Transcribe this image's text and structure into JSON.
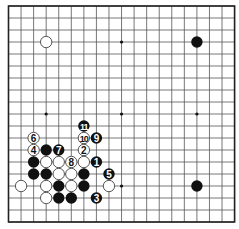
{
  "board": {
    "size": 19,
    "origin_x": 8.5,
    "origin_y": 6,
    "spacing_x": 12.56,
    "spacing_y": 12.0,
    "line_color": "#555555",
    "border_color": "#222222",
    "black_color": "#111111",
    "white_fill": "#ffffff",
    "white_stroke": "#444444",
    "star_points": [
      [
        3,
        3
      ],
      [
        9,
        3
      ],
      [
        15,
        3
      ],
      [
        3,
        9
      ],
      [
        9,
        9
      ],
      [
        15,
        9
      ],
      [
        3,
        15
      ],
      [
        9,
        15
      ],
      [
        15,
        15
      ]
    ]
  },
  "stones": [
    {
      "color": "white",
      "col": 3,
      "row": 3,
      "label": ""
    },
    {
      "color": "black",
      "col": 15,
      "row": 3,
      "label": ""
    },
    {
      "color": "black",
      "col": 15,
      "row": 15,
      "label": ""
    },
    {
      "color": "black",
      "col": 6,
      "row": 10,
      "label": "11"
    },
    {
      "color": "white",
      "col": 2,
      "row": 11,
      "label": "6"
    },
    {
      "color": "white",
      "col": 6,
      "row": 11,
      "label": "10"
    },
    {
      "color": "black",
      "col": 7,
      "row": 11,
      "label": "9"
    },
    {
      "color": "white",
      "col": 2,
      "row": 12,
      "label": "4"
    },
    {
      "color": "black",
      "col": 3,
      "row": 12,
      "label": ""
    },
    {
      "color": "black",
      "col": 4,
      "row": 12,
      "label": "7"
    },
    {
      "color": "white",
      "col": 6,
      "row": 12,
      "label": "2"
    },
    {
      "color": "black",
      "col": 2,
      "row": 13,
      "label": ""
    },
    {
      "color": "white",
      "col": 3,
      "row": 13,
      "label": ""
    },
    {
      "color": "white",
      "col": 4,
      "row": 13,
      "label": ""
    },
    {
      "color": "white",
      "col": 5,
      "row": 13,
      "label": "8"
    },
    {
      "color": "white",
      "col": 6,
      "row": 13,
      "label": ""
    },
    {
      "color": "black",
      "col": 7,
      "row": 13,
      "label": "1"
    },
    {
      "color": "black",
      "col": 2,
      "row": 14,
      "label": ""
    },
    {
      "color": "black",
      "col": 3,
      "row": 14,
      "label": ""
    },
    {
      "color": "white",
      "col": 4,
      "row": 14,
      "label": ""
    },
    {
      "color": "white",
      "col": 5,
      "row": 14,
      "label": ""
    },
    {
      "color": "black",
      "col": 6,
      "row": 14,
      "label": ""
    },
    {
      "color": "black",
      "col": 8,
      "row": 14,
      "label": "5"
    },
    {
      "color": "white",
      "col": 1,
      "row": 15,
      "label": ""
    },
    {
      "color": "white",
      "col": 3,
      "row": 15,
      "label": ""
    },
    {
      "color": "black",
      "col": 4,
      "row": 15,
      "label": ""
    },
    {
      "color": "white",
      "col": 5,
      "row": 15,
      "label": ""
    },
    {
      "color": "black",
      "col": 6,
      "row": 15,
      "label": ""
    },
    {
      "color": "white",
      "col": 8,
      "row": 15,
      "label": ""
    },
    {
      "color": "white",
      "col": 3,
      "row": 16,
      "label": ""
    },
    {
      "color": "black",
      "col": 4,
      "row": 16,
      "label": ""
    },
    {
      "color": "black",
      "col": 5,
      "row": 16,
      "label": ""
    },
    {
      "color": "black",
      "col": 7,
      "row": 16,
      "label": "3"
    }
  ]
}
